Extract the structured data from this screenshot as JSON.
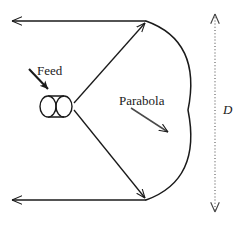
{
  "figure": {
    "background_color": "#ffffff",
    "stroke_color": "#1a1a1a",
    "width": 239,
    "height": 225,
    "labels": {
      "feed": "Feed",
      "parabola": "Parabola",
      "diameter": "D"
    },
    "elements": {
      "feed_horn": "cylinder-horn",
      "reflector": "parabola-curve",
      "ray_upper": "ray-from-feed-to-upper-rim",
      "ray_lower": "ray-from-feed-to-lower-rim",
      "beam_upper": "collimated-beam-upper",
      "beam_lower": "collimated-beam-lower",
      "dimension": "diameter-dimension-line"
    },
    "geometry": {
      "feed_focus": [
        72,
        106
      ],
      "feed_horn_box": [
        40,
        96,
        32,
        21
      ],
      "parabola_vertex": [
        188,
        110
      ],
      "parabola_top_rim": [
        146,
        21
      ],
      "parabola_bottom_rim": [
        146,
        200
      ],
      "beam_upper_y": 21,
      "beam_lower_y": 200,
      "beam_left_x": 11,
      "dimension_line_x": 215,
      "dimension_top_y": 13,
      "dimension_bottom_y": 213
    }
  }
}
